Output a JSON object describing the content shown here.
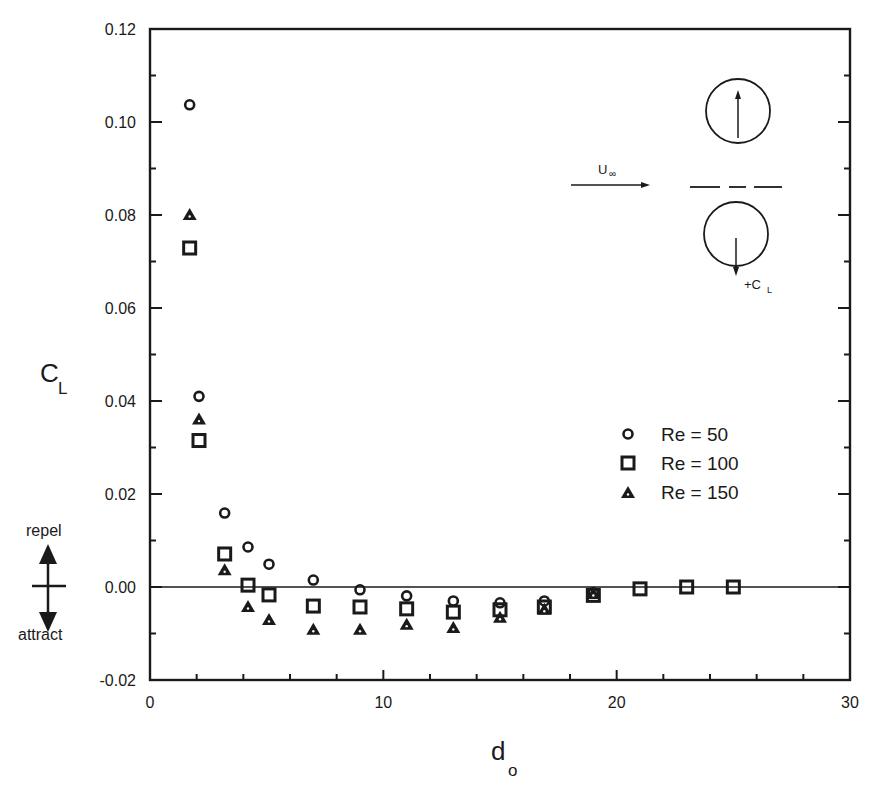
{
  "chart_data": {
    "type": "scatter",
    "title": "",
    "xlabel": "d",
    "xlabel_subscript": "o",
    "ylabel": "C",
    "ylabel_subscript": "L",
    "xlim": [
      0,
      30
    ],
    "ylim": [
      -0.02,
      0.12
    ],
    "x_ticks": [
      0,
      10,
      20,
      30
    ],
    "x_tick_labels": [
      "0",
      "10",
      "20",
      "30"
    ],
    "x_minor_step": 2,
    "y_ticks": [
      -0.02,
      0.0,
      0.02,
      0.04,
      0.06,
      0.08,
      0.1,
      0.12
    ],
    "y_tick_labels": [
      "-0.02",
      "0.00",
      "0.02",
      "0.04",
      "0.06",
      "0.08",
      "0.10",
      "0.12"
    ],
    "y_minor_step": 0.01,
    "grid": false,
    "zero_line": true,
    "legend_position": "right-middle",
    "series": [
      {
        "name": "Re = 50",
        "marker": "circle",
        "x": [
          1.7,
          2.1,
          3.2,
          4.2,
          5.1,
          7.0,
          9.0,
          11.0,
          13.0,
          15.0,
          16.9,
          19.0
        ],
        "y": [
          0.1037,
          0.041,
          0.0159,
          0.0086,
          0.0049,
          0.0015,
          -0.0006,
          -0.0019,
          -0.003,
          -0.0034,
          -0.003,
          -0.0012
        ]
      },
      {
        "name": "Re = 100",
        "marker": "square",
        "x": [
          1.7,
          2.1,
          3.2,
          4.2,
          5.1,
          7.0,
          9.0,
          11.0,
          13.0,
          15.0,
          16.9,
          19.0,
          21.0,
          23.0,
          25.0
        ],
        "y": [
          0.0729,
          0.0315,
          0.0071,
          0.0004,
          -0.0017,
          -0.0041,
          -0.0043,
          -0.0047,
          -0.0054,
          -0.0049,
          -0.0043,
          -0.0018,
          -0.0004,
          0.0,
          0.0
        ]
      },
      {
        "name": "Re = 150",
        "marker": "triangle",
        "x": [
          1.7,
          2.1,
          3.2,
          4.2,
          5.1,
          7.0,
          9.0,
          11.0,
          13.0,
          15.0,
          16.9,
          19.0
        ],
        "y": [
          0.08,
          0.036,
          0.0036,
          -0.0043,
          -0.0071,
          -0.0092,
          -0.0092,
          -0.0081,
          -0.0088,
          -0.0066,
          -0.0049,
          -0.0015
        ]
      }
    ],
    "annotations": {
      "repel_label": "repel",
      "attract_label": "attract",
      "inset": {
        "flow_label": "U",
        "flow_subscript": "∞",
        "force_label": "+C",
        "force_subscript": "L"
      }
    }
  },
  "colors": {
    "ink": "#1a1a1a",
    "background": "#ffffff"
  }
}
